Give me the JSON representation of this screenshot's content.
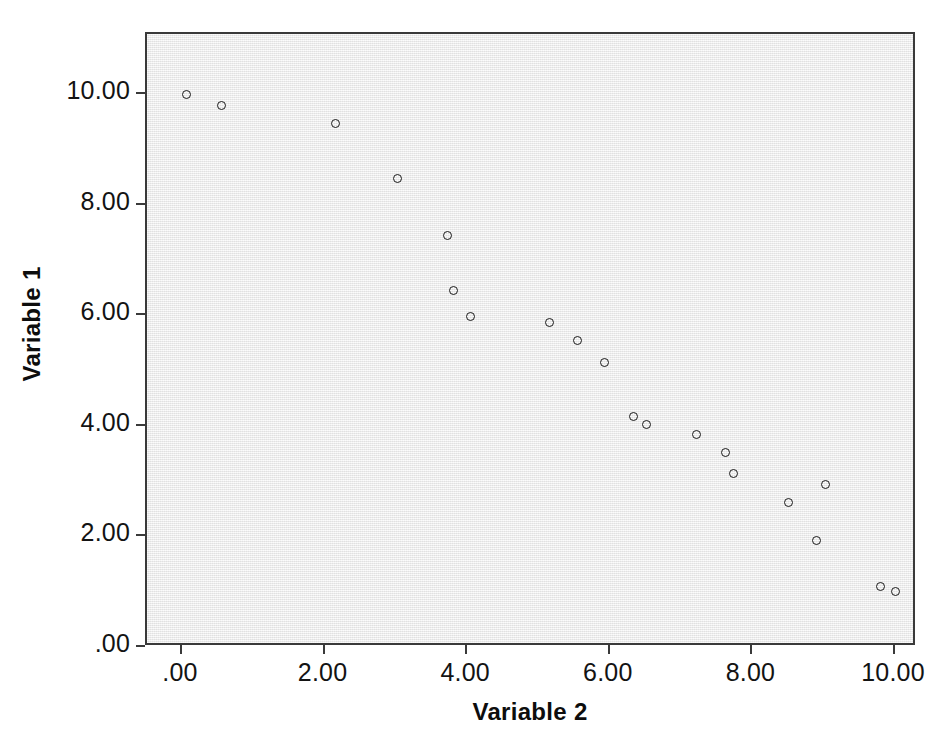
{
  "chart_data": {
    "type": "scatter",
    "title": "",
    "xlabel": "Variable 2",
    "ylabel": "Variable 1",
    "xlim": [
      -0.5,
      10.8
    ],
    "ylim": [
      -0.35,
      11.1
    ],
    "xticks": [
      0,
      2,
      4,
      6,
      8,
      10
    ],
    "xticklabels": [
      ".00",
      "2.00",
      "4.00",
      "6.00",
      "8.00",
      "10.00"
    ],
    "yticks": [
      0,
      2,
      4,
      6,
      8,
      10
    ],
    "yticklabels": [
      ".00",
      "2.00",
      "4.00",
      "6.00",
      "8.00",
      "10.00"
    ],
    "grid": false,
    "legend": false,
    "marker": "open-circle",
    "marker_edge_color": "#1b1b1b",
    "marker_face_color": "none",
    "panel_color": "#eeeeee",
    "frame_color": "#3a3a3a",
    "n_points": 20,
    "relationship": "strong negative linear",
    "points": [
      {
        "x": 0.06,
        "y": 10.0
      },
      {
        "x": 0.55,
        "y": 9.8
      },
      {
        "x": 2.15,
        "y": 9.47
      },
      {
        "x": 3.02,
        "y": 8.48
      },
      {
        "x": 3.73,
        "y": 7.45
      },
      {
        "x": 3.81,
        "y": 6.45
      },
      {
        "x": 4.04,
        "y": 5.97
      },
      {
        "x": 5.16,
        "y": 5.86
      },
      {
        "x": 5.54,
        "y": 5.54
      },
      {
        "x": 5.93,
        "y": 5.14
      },
      {
        "x": 6.33,
        "y": 4.16
      },
      {
        "x": 6.52,
        "y": 4.03
      },
      {
        "x": 7.22,
        "y": 3.85
      },
      {
        "x": 7.62,
        "y": 3.52
      },
      {
        "x": 7.73,
        "y": 3.13
      },
      {
        "x": 8.51,
        "y": 2.62
      },
      {
        "x": 9.02,
        "y": 2.93
      },
      {
        "x": 8.9,
        "y": 1.93
      },
      {
        "x": 9.8,
        "y": 1.1
      },
      {
        "x": 10.0,
        "y": 1.0
      }
    ]
  }
}
